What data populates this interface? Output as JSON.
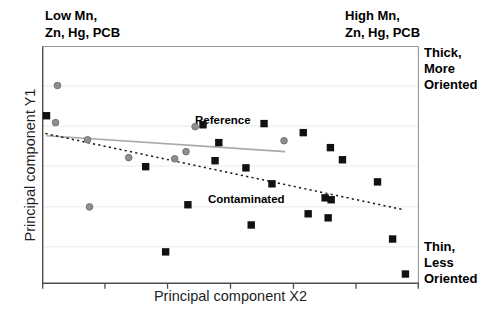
{
  "figure": {
    "top_left_label": "Low Mn,\nZn, Hg, PCB",
    "top_right_label": "High Mn,\nZn, Hg, PCB",
    "right_upper_label": "Thick,\nMore\nOriented",
    "right_lower_label": "Thin,\nLess\nOriented",
    "x_axis_label": "Principal component X2",
    "y_axis_label": "Principal component Y1"
  },
  "chart_data": {
    "type": "scatter",
    "title": "",
    "xlabel": "Principal component X2",
    "ylabel": "Principal component Y1",
    "axis_tick_labels": "none (unlabeled axes, coordinates normalized 0-1)",
    "xlim": [
      0,
      1
    ],
    "ylim": [
      0,
      1
    ],
    "grid": "horizontal",
    "legend_position": "none (in-plot annotations)",
    "gridline_y_fractions": [
      0.156,
      0.324,
      0.496,
      0.664,
      0.832
    ],
    "x_tick_fractions": [
      0,
      0.167,
      0.333,
      0.5,
      0.667,
      0.833,
      1
    ],
    "style": {
      "grid_color": "#e9e9e9",
      "frame_color": "#999999",
      "axis_color": "#4d4d4d",
      "background": "#ffffff"
    },
    "series": [
      {
        "name": "Reference",
        "marker": "circle",
        "marker_size": 3.3,
        "fill": "#8f8f8f",
        "edge": "#6b6b6b",
        "points": [
          [
            0.041,
            0.834
          ],
          [
            0.036,
            0.678
          ],
          [
            0.121,
            0.606
          ],
          [
            0.23,
            0.531
          ],
          [
            0.352,
            0.526
          ],
          [
            0.382,
            0.556
          ],
          [
            0.406,
            0.661
          ],
          [
            0.642,
            0.602
          ],
          [
            0.126,
            0.324
          ]
        ],
        "trend": {
          "style": "solid",
          "color": "#a8a8a8",
          "width": 1.6,
          "x1": 0.012,
          "y1": 0.623,
          "x2": 0.645,
          "y2": 0.556
        }
      },
      {
        "name": "Contaminated",
        "marker": "square",
        "marker_size": 7.4,
        "fill": "#111111",
        "edge": "#111111",
        "points": [
          [
            0.012,
            0.707
          ],
          [
            0.427,
            0.669
          ],
          [
            0.589,
            0.674
          ],
          [
            0.469,
            0.594
          ],
          [
            0.693,
            0.636
          ],
          [
            0.765,
            0.573
          ],
          [
            0.797,
            0.522
          ],
          [
            0.275,
            0.493
          ],
          [
            0.459,
            0.518
          ],
          [
            0.541,
            0.488
          ],
          [
            0.61,
            0.421
          ],
          [
            0.89,
            0.429
          ],
          [
            0.751,
            0.362
          ],
          [
            0.767,
            0.354
          ],
          [
            0.706,
            0.295
          ],
          [
            0.759,
            0.278
          ],
          [
            0.555,
            0.248
          ],
          [
            0.387,
            0.333
          ],
          [
            0.93,
            0.189
          ],
          [
            0.328,
            0.135
          ],
          [
            0.964,
            0.042
          ]
        ],
        "trend": {
          "style": "dotted",
          "color": "#1a1a1a",
          "width": 1.5,
          "x1": 0.009,
          "y1": 0.632,
          "x2": 0.959,
          "y2": 0.312
        }
      }
    ],
    "annotations": [
      {
        "text": "Reference",
        "x": 0.406,
        "y": 0.69,
        "bold": true
      },
      {
        "text": "Contaminated",
        "x": 0.44,
        "y": 0.358,
        "bold": true
      }
    ]
  }
}
